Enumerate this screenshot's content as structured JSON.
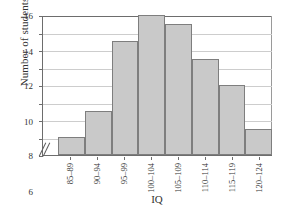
{
  "chart_data": {
    "type": "bar",
    "title": "",
    "xlabel": "IQ",
    "ylabel": "Number of students",
    "categories": [
      "85–89",
      "90–94",
      "95–99",
      "100–104",
      "105–109",
      "110–114",
      "115–119",
      "120–124"
    ],
    "values": [
      2,
      5,
      13,
      16,
      15,
      11,
      8,
      3
    ],
    "ylim": [
      0,
      16
    ],
    "yticks": [
      0,
      2,
      4,
      6,
      8,
      10,
      12,
      14,
      16
    ],
    "ytick_labels": [
      "0",
      "2",
      "4",
      "6",
      "8",
      "10",
      "12",
      "14",
      "16"
    ],
    "grid": true,
    "legend": false,
    "axis_break": "//",
    "bar_color": "#c9c9c9",
    "bar_border_color": "#7e7e7e",
    "grid_color": "#cdcdcd",
    "axis_color": "#6d6d6d",
    "background": "#ffffff"
  }
}
